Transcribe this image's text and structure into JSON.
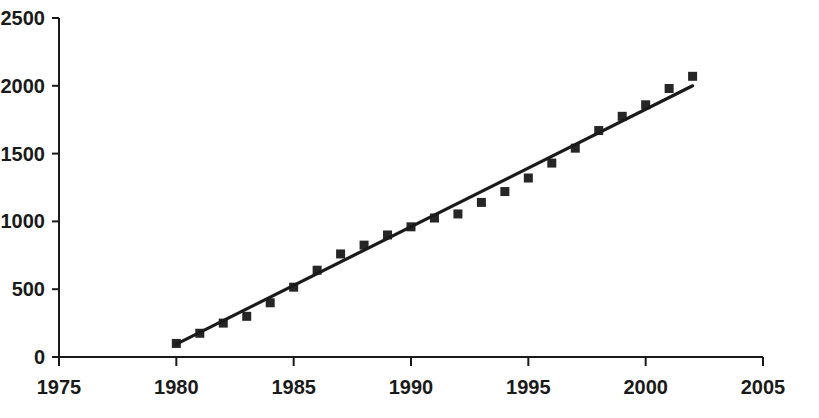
{
  "chart_data": {
    "type": "scatter",
    "title": "",
    "subtitle": "",
    "xlabel": "",
    "ylabel": "",
    "xlim": [
      1975,
      2005
    ],
    "ylim": [
      0,
      2500
    ],
    "grid": false,
    "legend": null,
    "x_ticks": [
      1975,
      1980,
      1985,
      1990,
      1995,
      2000,
      2005
    ],
    "x_tick_labels": [
      "1975",
      "1980",
      "1985",
      "1990",
      "1995",
      "2000",
      "2005"
    ],
    "y_ticks": [
      0,
      500,
      1000,
      1500,
      2000,
      2500
    ],
    "y_tick_labels": [
      "0",
      "500",
      "1000",
      "1500",
      "2000",
      "2500"
    ],
    "marker_style": "filled-square",
    "marker_color": "#262626",
    "line_color": "#1a1a1a",
    "axis_color": "#1a1a1a",
    "series": [
      {
        "name": "data-points",
        "type": "scatter",
        "x": [
          1980,
          1981,
          1982,
          1983,
          1984,
          1985,
          1986,
          1987,
          1988,
          1989,
          1990,
          1991,
          1992,
          1993,
          1994,
          1995,
          1996,
          1997,
          1998,
          1999,
          2000,
          2001,
          2002
        ],
        "values": [
          100,
          175,
          250,
          300,
          400,
          515,
          640,
          760,
          825,
          900,
          960,
          1025,
          1055,
          1140,
          1220,
          1320,
          1430,
          1540,
          1670,
          1775,
          1860,
          1980,
          2070
        ]
      },
      {
        "name": "trend-line",
        "type": "line",
        "x": [
          1980,
          2002
        ],
        "values": [
          95,
          2000
        ]
      }
    ]
  }
}
